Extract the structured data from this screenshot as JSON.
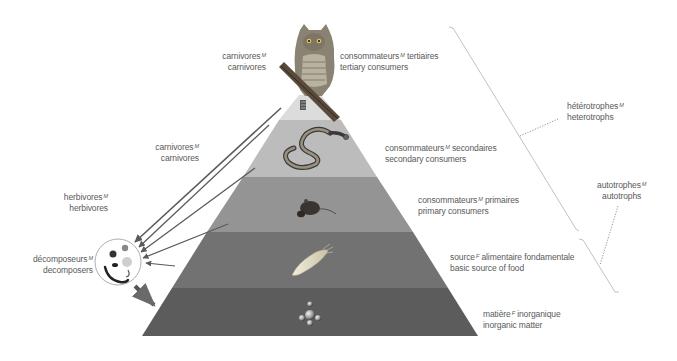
{
  "diagram": {
    "colors": {
      "level_top": "#d9d9d9",
      "level_secondary": "#b9b9b9",
      "level_primary": "#8f8f8f",
      "level_basic": "#707070",
      "level_inorganic": "#5a5a5a",
      "arrow": "#5a5a5a",
      "bracket": "#bbbbbb",
      "text": "#5a5a5a"
    },
    "levels": [
      {
        "id": "tertiary",
        "fr": "consommateurs",
        "fr_gender": "M",
        "fr_rest": " tertiaires",
        "en": "tertiary consumers",
        "icon": "owl-icon"
      },
      {
        "id": "secondary",
        "fr": "consommateurs",
        "fr_gender": "M",
        "fr_rest": " secondaires",
        "en": "secondary consumers",
        "icon": "snake-icon"
      },
      {
        "id": "primary",
        "fr": "consommateurs",
        "fr_gender": "M",
        "fr_rest": " primaires",
        "en": "primary consumers",
        "icon": "rat-icon"
      },
      {
        "id": "basic",
        "fr": "source",
        "fr_gender": "F",
        "fr_rest": " alimentaire fondamentale",
        "en": "basic source of food",
        "icon": "plankton-icon"
      },
      {
        "id": "inorganic",
        "fr": "matière",
        "fr_gender": "F",
        "fr_rest": " inorganique",
        "en": "inorganic matter",
        "icon": "molecule-icon"
      }
    ],
    "left_labels": [
      {
        "id": "carnivores_top",
        "fr": "carnivores",
        "fr_gender": "M",
        "en": "carnivores"
      },
      {
        "id": "carnivores_mid",
        "fr": "carnivores",
        "fr_gender": "M",
        "en": "carnivores"
      },
      {
        "id": "herbivores",
        "fr": "herbivores",
        "fr_gender": "M",
        "en": "herbivores"
      },
      {
        "id": "decomposers",
        "fr": "décomposeurs",
        "fr_gender": "M",
        "en": "decomposers"
      }
    ],
    "groups": [
      {
        "id": "heterotrophs",
        "fr": "hétérotrophes",
        "fr_gender": "M",
        "en": "heterotrophs"
      },
      {
        "id": "autotrophs",
        "fr": "autotrophes",
        "fr_gender": "M",
        "en": "autotrophs"
      }
    ]
  }
}
